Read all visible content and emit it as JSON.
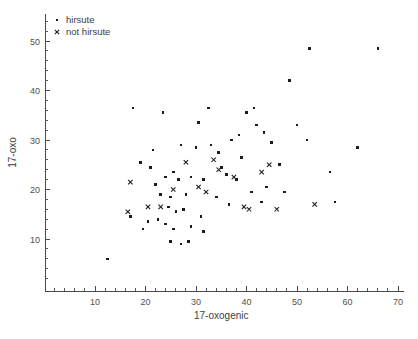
{
  "chart_data": {
    "type": "scatter",
    "title": "",
    "xlabel": "17-oxogenic",
    "ylabel": "17-oxo",
    "xlim": [
      0,
      72
    ],
    "ylim": [
      0,
      55
    ],
    "xticks": [
      10,
      20,
      30,
      40,
      50,
      60,
      70
    ],
    "yticks": [
      10,
      20,
      30,
      40,
      50
    ],
    "x_minor_step": 2,
    "y_minor_step": 2,
    "grid": false,
    "legend_position": "top-left",
    "legend": [
      {
        "label": "hirsute",
        "marker": "square"
      },
      {
        "label": "not hirsute",
        "marker": "cross"
      }
    ],
    "series": [
      {
        "name": "hirsute",
        "marker": "square",
        "points": [
          [
            17.5,
            36.5
          ],
          [
            23.5,
            35.5
          ],
          [
            32.5,
            36.5
          ],
          [
            21.5,
            28.0
          ],
          [
            27.0,
            29.0
          ],
          [
            30.0,
            28.5
          ],
          [
            33.0,
            29.0
          ],
          [
            34.5,
            27.5
          ],
          [
            19.0,
            25.5
          ],
          [
            21.0,
            24.5
          ],
          [
            24.0,
            22.5
          ],
          [
            25.5,
            23.5
          ],
          [
            22.0,
            21.0
          ],
          [
            26.5,
            22.0
          ],
          [
            29.0,
            22.5
          ],
          [
            31.5,
            22.0
          ],
          [
            23.0,
            19.0
          ],
          [
            25.0,
            18.5
          ],
          [
            28.0,
            19.0
          ],
          [
            24.5,
            16.5
          ],
          [
            26.0,
            15.5
          ],
          [
            27.5,
            16.0
          ],
          [
            22.5,
            14.0
          ],
          [
            24.0,
            13.0
          ],
          [
            25.5,
            12.0
          ],
          [
            29.0,
            12.5
          ],
          [
            31.0,
            14.5
          ],
          [
            20.5,
            13.5
          ],
          [
            19.5,
            12.0
          ],
          [
            17.0,
            14.5
          ],
          [
            37.0,
            30.0
          ],
          [
            38.5,
            31.0
          ],
          [
            40.0,
            35.5
          ],
          [
            41.5,
            36.5
          ],
          [
            42.0,
            33.0
          ],
          [
            39.0,
            26.5
          ],
          [
            43.5,
            31.5
          ],
          [
            45.0,
            29.5
          ],
          [
            46.5,
            25.0
          ],
          [
            36.0,
            23.0
          ],
          [
            38.0,
            22.0
          ],
          [
            41.0,
            19.5
          ],
          [
            44.0,
            20.5
          ],
          [
            47.5,
            19.5
          ],
          [
            43.0,
            17.5
          ],
          [
            36.5,
            17.0
          ],
          [
            34.0,
            18.5
          ],
          [
            52.5,
            48.5
          ],
          [
            66.0,
            48.5
          ],
          [
            48.5,
            42.0
          ],
          [
            50.0,
            33.0
          ],
          [
            52.0,
            30.0
          ],
          [
            56.5,
            23.5
          ],
          [
            57.5,
            17.5
          ],
          [
            62.0,
            28.5
          ],
          [
            30.5,
            33.5
          ],
          [
            35.0,
            24.5
          ],
          [
            12.5,
            6.0
          ],
          [
            28.5,
            9.5
          ],
          [
            27.0,
            9.0
          ],
          [
            25.0,
            9.5
          ],
          [
            31.5,
            11.5
          ]
        ]
      },
      {
        "name": "not hirsute",
        "marker": "cross",
        "points": [
          [
            17.0,
            21.5
          ],
          [
            28.0,
            25.5
          ],
          [
            33.5,
            26.0
          ],
          [
            34.5,
            24.0
          ],
          [
            30.5,
            20.5
          ],
          [
            32.0,
            19.5
          ],
          [
            37.5,
            22.5
          ],
          [
            43.0,
            23.5
          ],
          [
            39.5,
            16.5
          ],
          [
            40.5,
            16.0
          ],
          [
            46.0,
            16.0
          ],
          [
            53.5,
            17.0
          ],
          [
            20.5,
            16.5
          ],
          [
            23.0,
            16.5
          ],
          [
            16.5,
            15.5
          ],
          [
            25.5,
            20.0
          ],
          [
            44.5,
            25.0
          ]
        ]
      }
    ]
  }
}
